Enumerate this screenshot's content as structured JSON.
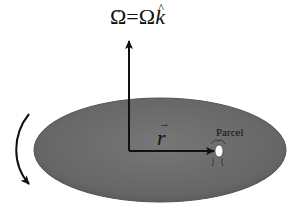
{
  "diagram": {
    "title_equation": {
      "lhs": "Ω",
      "lhs_vector_mark": "→",
      "equals": "=",
      "rhs_scalar": "Ω",
      "rhs_unit": "k",
      "rhs_unit_mark": "^"
    },
    "radius_label": {
      "symbol": "r",
      "vector_mark": "→"
    },
    "parcel_label": "Parcel",
    "icons": {
      "rotation_arrow": "curved-arrow-clockwise",
      "omega_axis": "vertical-arrow-up",
      "radius_vector": "horizontal-arrow-right",
      "parcel": "parcel-dot"
    },
    "colors": {
      "disk_fill": "#6b6b6b",
      "disk_edge": "#5a5a5a",
      "arrow": "#111111",
      "parcel": "#ffffff",
      "background": "#ffffff"
    }
  }
}
